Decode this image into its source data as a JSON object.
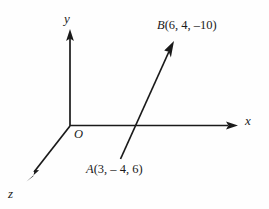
{
  "figure": {
    "kind": "3d-coordinate-axes-with-vector",
    "background_color": "#fefefe",
    "stroke_color": "#1a1a1a",
    "text_color": "#1a1a1a"
  },
  "axes": {
    "y_label": "y",
    "x_label": "x",
    "z_label": "z",
    "origin_label": "O"
  },
  "points": {
    "B": {
      "label": "B(6, 4, –10)",
      "name": "B",
      "coords": [
        6,
        4,
        -10
      ]
    },
    "A": {
      "label": "A(3, – 4, 6)",
      "name": "A",
      "coords": [
        3,
        -4,
        6
      ]
    }
  },
  "chart_data": {
    "type": "scatter",
    "title": "",
    "xlabel": "x",
    "ylabel": "y",
    "zlabel": "z",
    "origin": "O",
    "annotations": [
      "B(6, 4, –10)",
      "A(3, – 4, 6)"
    ],
    "series": [
      {
        "name": "vector AB",
        "points": [
          {
            "label": "A(3, – 4, 6)",
            "x": 3,
            "y": -4,
            "z": 6
          },
          {
            "label": "B(6, 4, –10)",
            "x": 6,
            "y": 4,
            "z": -10
          }
        ]
      }
    ],
    "grid": false,
    "legend": "none"
  }
}
